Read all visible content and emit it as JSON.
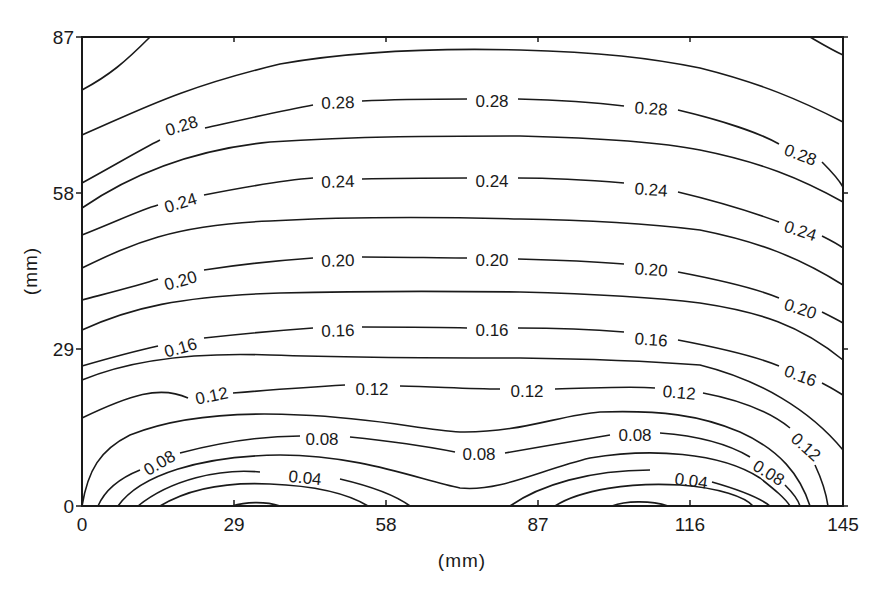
{
  "chart_data": {
    "type": "contour",
    "title": "",
    "xlabel": "(mm)",
    "ylabel": "(mm)",
    "xlim": [
      0,
      145
    ],
    "ylim": [
      0,
      87
    ],
    "xticks": [
      0,
      29,
      58,
      87,
      116,
      145
    ],
    "yticks": [
      0,
      29,
      58,
      87
    ],
    "xtick_labels": [
      "0",
      "29",
      "58",
      "87",
      "116",
      "145"
    ],
    "ytick_labels": [
      "0",
      "29",
      "58",
      "87"
    ],
    "grid": false,
    "legend": null,
    "contour_interval": 0.02,
    "labeled_levels": [
      0.04,
      0.08,
      0.12,
      0.16,
      0.2,
      0.24,
      0.28
    ],
    "levels": [
      0.0,
      0.02,
      0.04,
      0.06,
      0.08,
      0.1,
      0.12,
      0.14,
      0.16,
      0.18,
      0.2,
      0.22,
      0.24,
      0.26,
      0.28,
      0.3,
      0.32
    ],
    "contour_label_instances": [
      {
        "text": "0.28",
        "x_mm": 22,
        "y_mm": 73
      },
      {
        "text": "0.28",
        "x_mm": 57,
        "y_mm": 77
      },
      {
        "text": "0.28",
        "x_mm": 84,
        "y_mm": 77
      },
      {
        "text": "0.28",
        "x_mm": 115,
        "y_mm": 76
      },
      {
        "text": "0.28",
        "x_mm": 139,
        "y_mm": 67
      },
      {
        "text": "0.24",
        "x_mm": 22,
        "y_mm": 59
      },
      {
        "text": "0.24",
        "x_mm": 57,
        "y_mm": 63
      },
      {
        "text": "0.24",
        "x_mm": 84,
        "y_mm": 63
      },
      {
        "text": "0.24",
        "x_mm": 115,
        "y_mm": 62
      },
      {
        "text": "0.24",
        "x_mm": 139,
        "y_mm": 52
      },
      {
        "text": "0.20",
        "x_mm": 22,
        "y_mm": 42
      },
      {
        "text": "0.20",
        "x_mm": 57,
        "y_mm": 46
      },
      {
        "text": "0.20",
        "x_mm": 84,
        "y_mm": 46
      },
      {
        "text": "0.20",
        "x_mm": 115,
        "y_mm": 45
      },
      {
        "text": "0.20",
        "x_mm": 139,
        "y_mm": 37
      },
      {
        "text": "0.16",
        "x_mm": 22,
        "y_mm": 30
      },
      {
        "text": "0.16",
        "x_mm": 57,
        "y_mm": 33
      },
      {
        "text": "0.16",
        "x_mm": 84,
        "y_mm": 33
      },
      {
        "text": "0.16",
        "x_mm": 115,
        "y_mm": 32
      },
      {
        "text": "0.16",
        "x_mm": 139,
        "y_mm": 24
      },
      {
        "text": "0.12",
        "x_mm": 25,
        "y_mm": 21
      },
      {
        "text": "0.12",
        "x_mm": 62,
        "y_mm": 22
      },
      {
        "text": "0.12",
        "x_mm": 88,
        "y_mm": 22
      },
      {
        "text": "0.12",
        "x_mm": 111,
        "y_mm": 21
      },
      {
        "text": "0.12",
        "x_mm": 140,
        "y_mm": 11
      },
      {
        "text": "0.08",
        "x_mm": 16,
        "y_mm": 8
      },
      {
        "text": "0.08",
        "x_mm": 49,
        "y_mm": 13
      },
      {
        "text": "0.08",
        "x_mm": 77,
        "y_mm": 10
      },
      {
        "text": "0.08",
        "x_mm": 106,
        "y_mm": 14
      },
      {
        "text": "0.08",
        "x_mm": 131,
        "y_mm": 7
      },
      {
        "text": "0.04",
        "x_mm": 43,
        "y_mm": 5
      },
      {
        "text": "0.04",
        "x_mm": 121,
        "y_mm": 5
      }
    ]
  },
  "render": {
    "plot": {
      "left": 82,
      "right": 843,
      "top": 37,
      "bottom": 506
    },
    "contours": [
      {
        "level": 0.32,
        "d": "M82,90 C110,75 125,62 150,37"
      },
      {
        "level": 0.32,
        "d": "M810,37 C822,44 832,50 843,55"
      },
      {
        "level": 0.3,
        "d": "M82,135 C140,110 180,88 280,64 C360,50 440,48 520,50 C600,52 650,58 700,68 C760,83 800,100 843,122"
      },
      {
        "level": 0.28,
        "d": "M82,183 C115,165 140,150 160,140 M205,128 C250,118 285,110 313,105 M362,101 C400,99 440,99 467,99 M518,99 C560,100 600,103 624,106 M678,110 C720,120 760,133 779,144 M822,162 C830,170 838,178 843,187"
      },
      {
        "level": 0.26,
        "d": "M82,208 C130,175 190,150 270,142 C360,136 440,136 520,136 C600,138 660,142 700,150 C760,162 800,178 843,202"
      },
      {
        "level": 0.24,
        "d": "M82,235 C120,220 140,210 158,205 M204,195 C250,186 285,180 313,178 M362,179 C400,178 440,178 467,178 M518,178 C560,178 600,181 624,183 M678,192 C720,202 760,215 779,222 M822,236 C830,240 838,244 843,248"
      },
      {
        "level": 0.22,
        "d": "M82,268 C130,245 170,225 270,221 C360,216 440,217 520,219 C600,220 660,225 700,230 C760,242 800,258 843,285"
      },
      {
        "level": 0.2,
        "d": "M82,300 C120,290 140,285 158,279 M204,270 C250,263 285,260 313,258 M362,257 C400,257 440,258 467,258 M518,259 C560,260 600,262 624,264 M678,272 C720,280 760,290 779,298 M822,312 C830,316 838,320 843,323"
      },
      {
        "level": 0.18,
        "d": "M82,330 C130,308 180,296 280,293 C360,291 440,291 520,292 C600,294 660,298 700,303 C760,312 800,325 843,360"
      },
      {
        "level": 0.16,
        "d": "M82,366 C120,355 140,350 158,346 M204,338 C250,333 285,330 313,328 M362,327 C400,327 440,327 467,328 M518,328 C560,328 600,330 624,332 M678,340 C720,348 760,358 779,366 M822,383 C830,387 838,392 843,395"
      },
      {
        "level": 0.14,
        "d": "M82,380 C130,360 190,352 270,355 C360,358 440,358 520,358 C600,359 660,362 700,365 C760,380 810,410 843,450"
      },
      {
        "level": 0.12,
        "d": "M82,418 C130,395 160,385 188,398 M233,393 C270,390 310,387 345,385 M400,386 C440,387 470,389 500,389 M555,389 C600,388 630,386 655,388 M703,393 C740,400 770,412 790,428 M815,465 C822,480 826,492 828,506"
      },
      {
        "level": 0.1,
        "d": "M82,506 C88,470 100,450 130,435 C180,415 240,412 300,415 C380,418 420,430 460,432 C520,433 560,415 600,412 C660,410 700,415 740,432 C780,450 800,475 810,506"
      },
      {
        "level": 0.08,
        "d": "M98,506 C105,490 120,478 140,470 M180,453 C230,440 270,436 300,436 M350,437 C390,441 430,447 455,452 M505,453 C540,447 580,440 610,435 M660,433 C700,436 730,445 750,457 M785,485 C792,492 798,499 800,506"
      },
      {
        "level": 0.06,
        "d": "M118,506 C140,475 200,456 280,455 C360,455 420,480 460,488 C500,492 540,470 590,458 C650,448 720,452 760,478 C775,490 785,498 790,506"
      },
      {
        "level": 0.04,
        "d": "M138,506 C170,480 220,468 260,472 M340,479 C370,486 395,495 410,506 M510,506 C540,485 590,470 650,470 M712,482 C740,490 760,498 770,506"
      },
      {
        "level": 0.02,
        "d": "M160,506 C190,488 230,482 270,484 C320,486 350,495 368,506 M555,506 C580,490 630,482 680,485 C720,488 745,497 753,506"
      },
      {
        "level": 0.0,
        "d": "M232,506 C245,502 265,501 280,506 M612,506 C625,501 650,500 668,506"
      }
    ],
    "labels": [
      {
        "text": "0.28",
        "x": 182,
        "y": 127,
        "rot": -17
      },
      {
        "text": "0.28",
        "x": 338,
        "y": 104,
        "rot": -2
      },
      {
        "text": "0.28",
        "x": 492,
        "y": 103,
        "rot": 0
      },
      {
        "text": "0.28",
        "x": 651,
        "y": 110,
        "rot": 4
      },
      {
        "text": "0.28",
        "x": 800,
        "y": 156,
        "rot": 20
      },
      {
        "text": "0.24",
        "x": 181,
        "y": 204,
        "rot": -17
      },
      {
        "text": "0.24",
        "x": 338,
        "y": 183,
        "rot": -2
      },
      {
        "text": "0.24",
        "x": 492,
        "y": 183,
        "rot": 0
      },
      {
        "text": "0.24",
        "x": 651,
        "y": 191,
        "rot": 4
      },
      {
        "text": "0.24",
        "x": 800,
        "y": 232,
        "rot": 18
      },
      {
        "text": "0.20",
        "x": 181,
        "y": 282,
        "rot": -16
      },
      {
        "text": "0.20",
        "x": 338,
        "y": 262,
        "rot": -2
      },
      {
        "text": "0.20",
        "x": 492,
        "y": 262,
        "rot": 0
      },
      {
        "text": "0.20",
        "x": 651,
        "y": 271,
        "rot": 4
      },
      {
        "text": "0.20",
        "x": 800,
        "y": 310,
        "rot": 18
      },
      {
        "text": "0.16",
        "x": 181,
        "y": 349,
        "rot": -16
      },
      {
        "text": "0.16",
        "x": 338,
        "y": 332,
        "rot": -2
      },
      {
        "text": "0.16",
        "x": 492,
        "y": 332,
        "rot": 0
      },
      {
        "text": "0.16",
        "x": 651,
        "y": 341,
        "rot": 4
      },
      {
        "text": "0.16",
        "x": 800,
        "y": 377,
        "rot": 20
      },
      {
        "text": "0.12",
        "x": 212,
        "y": 397,
        "rot": -12
      },
      {
        "text": "0.12",
        "x": 372,
        "y": 391,
        "rot": 0
      },
      {
        "text": "0.12",
        "x": 527,
        "y": 393,
        "rot": 0
      },
      {
        "text": "0.12",
        "x": 679,
        "y": 394,
        "rot": 5
      },
      {
        "text": "0.12",
        "x": 805,
        "y": 448,
        "rot": 42
      },
      {
        "text": "0.08",
        "x": 160,
        "y": 464,
        "rot": -30
      },
      {
        "text": "0.08",
        "x": 322,
        "y": 441,
        "rot": 0
      },
      {
        "text": "0.08",
        "x": 479,
        "y": 456,
        "rot": 0
      },
      {
        "text": "0.08",
        "x": 635,
        "y": 437,
        "rot": 0
      },
      {
        "text": "0.08",
        "x": 768,
        "y": 474,
        "rot": 32
      },
      {
        "text": "0.04",
        "x": 305,
        "y": 479,
        "rot": 6
      },
      {
        "text": "0.04",
        "x": 691,
        "y": 482,
        "rot": 8
      }
    ],
    "xticks_px": [
      82,
      234,
      386,
      538,
      690,
      843
    ],
    "yticks_px": [
      506,
      349,
      193,
      37
    ]
  }
}
